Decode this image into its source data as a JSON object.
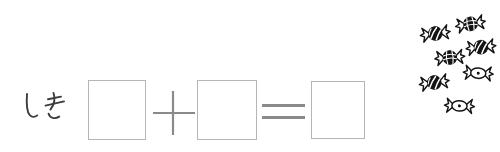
{
  "colors": {
    "paper": "#ffffff",
    "ink": "#141414",
    "box_border": "#b5b5b5",
    "operator": "#8a8a8a",
    "label": "#3c3c3c"
  },
  "equation": {
    "label": "しき",
    "plus": "+",
    "equals": "=",
    "boxes": [
      {
        "name": "addend-1",
        "value": ""
      },
      {
        "name": "addend-2",
        "value": ""
      },
      {
        "name": "sum",
        "value": ""
      }
    ]
  },
  "illustration": {
    "subject": "wrapped candies",
    "count": 7,
    "style_counts": {
      "swirl": 3,
      "knot": 2,
      "plain": 2
    },
    "items": [
      {
        "style": "knot",
        "x": 452,
        "y": 17,
        "rotation": -10
      },
      {
        "style": "swirl",
        "x": 417,
        "y": 26,
        "rotation": -8
      },
      {
        "style": "swirl",
        "x": 463,
        "y": 39,
        "rotation": -6
      },
      {
        "style": "knot",
        "x": 432,
        "y": 49,
        "rotation": -5
      },
      {
        "style": "plain",
        "x": 462,
        "y": 62,
        "rotation": 4
      },
      {
        "style": "swirl",
        "x": 416,
        "y": 75,
        "rotation": -8
      },
      {
        "style": "plain",
        "x": 443,
        "y": 95,
        "rotation": 3
      }
    ]
  }
}
